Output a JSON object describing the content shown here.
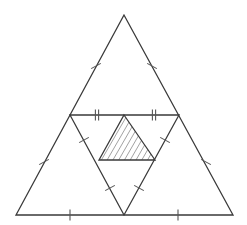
{
  "figure": {
    "canvas": {
      "width": 247,
      "height": 225,
      "background": "#ffffff"
    },
    "stroke_color": "#3a3a3a",
    "stroke_color_light": "#6e6e6e",
    "hatch_color": "#7d7d7d",
    "tick_color": "#555555",
    "stroke_width": 1.3,
    "tick_width": 1.1,
    "hatch_width": 0.8
  },
  "points": {
    "outer_apex": {
      "name": "A",
      "x": 124,
      "y": 15
    },
    "outer_bottom_left": {
      "name": "B",
      "x": 16,
      "y": 215
    },
    "outer_bottom_right": {
      "name": "C",
      "x": 233,
      "y": 215
    },
    "mid_left": {
      "name": "F",
      "x": 70,
      "y": 115
    },
    "mid_right": {
      "name": "E",
      "x": 179,
      "y": 115
    },
    "mid_bottom": {
      "name": "D",
      "x": 124,
      "y": 215
    },
    "inner_apex": {
      "name": "G",
      "x": 124,
      "y": 115
    },
    "inner_base_left": {
      "name": "I",
      "x": 99,
      "y": 160
    },
    "inner_base_right": {
      "name": "H",
      "x": 155,
      "y": 160
    }
  },
  "shapes": {
    "outer_triangle": {
      "label": "outer-triangle",
      "points": "124,15 16,215 233,215",
      "fill": "none"
    },
    "medial_triangle": {
      "label": "medial-triangle",
      "points": "70,115 179,115 124,215",
      "fill": "none"
    },
    "shaded_triangle": {
      "label": "shaded-triangle",
      "points": "124,115 155,160 99,160",
      "fill": "none"
    }
  },
  "edges": [
    {
      "name": "outer-edge-left",
      "x1": 124,
      "y1": 15,
      "x2": 16,
      "y2": 215
    },
    {
      "name": "outer-edge-right",
      "x1": 124,
      "y1": 15,
      "x2": 233,
      "y2": 215
    },
    {
      "name": "outer-edge-base",
      "x1": 16,
      "y1": 215,
      "x2": 233,
      "y2": 215
    },
    {
      "name": "medial-edge-top",
      "x1": 70,
      "y1": 115,
      "x2": 179,
      "y2": 115
    },
    {
      "name": "medial-edge-left",
      "x1": 70,
      "y1": 115,
      "x2": 124,
      "y2": 215
    },
    {
      "name": "medial-edge-right",
      "x1": 179,
      "y1": 115,
      "x2": 124,
      "y2": 215
    },
    {
      "name": "shaded-edge-left",
      "x1": 124,
      "y1": 115,
      "x2": 99,
      "y2": 160
    },
    {
      "name": "shaded-edge-right",
      "x1": 124,
      "y1": 115,
      "x2": 155,
      "y2": 160
    },
    {
      "name": "shaded-edge-base",
      "x1": 99,
      "y1": 160,
      "x2": 155,
      "y2": 160
    }
  ],
  "tick_marks": [
    {
      "name": "tick-outer-left-upper",
      "cx": 96,
      "cy": 66,
      "angle": 61.6,
      "count": 1,
      "length": 11
    },
    {
      "name": "tick-outer-right-upper",
      "cx": 152,
      "cy": 66,
      "angle": -61.6,
      "count": 1,
      "length": 11
    },
    {
      "name": "tick-outer-left-lower",
      "cx": 44,
      "cy": 162,
      "angle": 61.6,
      "count": 1,
      "length": 11
    },
    {
      "name": "tick-outer-right-lower",
      "cx": 206,
      "cy": 162,
      "angle": -61.6,
      "count": 1,
      "length": 11
    },
    {
      "name": "tick-outer-base-left",
      "cx": 70,
      "cy": 215,
      "angle": 0,
      "count": 1,
      "length": 11
    },
    {
      "name": "tick-outer-base-right",
      "cx": 178,
      "cy": 215,
      "angle": 0,
      "count": 1,
      "length": 11
    },
    {
      "name": "tick-medial-top-left",
      "cx": 97,
      "cy": 115,
      "angle": 0,
      "count": 2,
      "length": 11
    },
    {
      "name": "tick-medial-top-right",
      "cx": 154,
      "cy": 115,
      "angle": 0,
      "count": 2,
      "length": 11
    },
    {
      "name": "tick-medial-left-upper",
      "cx": 84,
      "cy": 140,
      "angle": 61.6,
      "count": 1,
      "length": 11
    },
    {
      "name": "tick-medial-right-upper",
      "cx": 165,
      "cy": 140,
      "angle": -61.6,
      "count": 1,
      "length": 11
    },
    {
      "name": "tick-medial-left-lower",
      "cx": 110,
      "cy": 188,
      "angle": 61.6,
      "count": 1,
      "length": 11
    },
    {
      "name": "tick-medial-right-lower",
      "cx": 139,
      "cy": 188,
      "angle": -61.6,
      "count": 1,
      "length": 11
    }
  ],
  "hatching": {
    "name": "shaded-triangle-hatching",
    "description": "parallel diagonal lines filling the inner triangle",
    "angle_deg": 60,
    "spacing": 5,
    "color": "#8a8a8a"
  }
}
